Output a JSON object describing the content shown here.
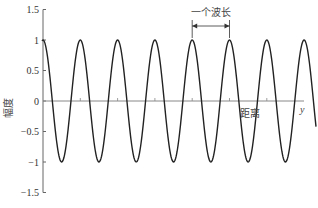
{
  "chart_data": {
    "type": "line",
    "title": "",
    "xlabel": "距离",
    "ylabel": "幅度",
    "x_axis_end_label": "y",
    "ylim": [
      -1.5,
      1.5
    ],
    "yticks": [
      1.5,
      1,
      0.5,
      0,
      -0.5,
      -1,
      -1.5
    ],
    "ytick_labels": [
      "1.5",
      "1",
      "0.5",
      "0",
      "−0.5",
      "−1",
      "−1.5"
    ],
    "grid": false,
    "legend": null,
    "series": [
      {
        "name": "cos wave",
        "function": "y = cos(2*pi*x / wavelength)",
        "amplitude": 1,
        "wavelength_px": 37.3,
        "cycles_shown": 7.3,
        "end_value": -0.56,
        "color": "#222222"
      }
    ],
    "annotations": [
      {
        "text": "一个波长",
        "type": "dimension-arrow",
        "from_peak": 4,
        "to_peak": 5
      }
    ],
    "x_minor_ticks": 5
  }
}
